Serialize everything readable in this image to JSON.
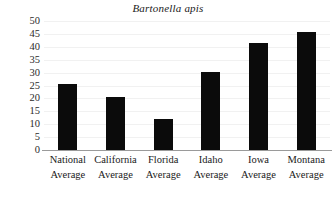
{
  "chart_data": {
    "type": "bar",
    "title": "Bartonella apis",
    "xlabel": "",
    "ylabel": "",
    "categories": [
      "National Average",
      "California Average",
      "Florida Average",
      "Idaho Average",
      "Iowa Average",
      "Montana Average"
    ],
    "category_lines": [
      [
        "National",
        "Average"
      ],
      [
        "California",
        "Average"
      ],
      [
        "Florida",
        "Average"
      ],
      [
        "Idaho",
        "Average"
      ],
      [
        "Iowa",
        "Average"
      ],
      [
        "Montana",
        "Average"
      ]
    ],
    "values": [
      25.6,
      20.5,
      12.0,
      30.2,
      41.5,
      45.7
    ],
    "ylim": [
      0,
      50
    ],
    "ytick_values": [
      0,
      5,
      10,
      15,
      20,
      25,
      30,
      35,
      40,
      45,
      50
    ],
    "ytick_labels": [
      "0",
      "5",
      "10",
      "15",
      "20",
      "25",
      "30",
      "35",
      "40",
      "45",
      "50"
    ],
    "grid": true,
    "grid_axis": "y",
    "legend": false,
    "bar_color": "#0b0b0b",
    "grid_color": "#f1f1f1",
    "axis_color": "#9a9a9a",
    "background_color": "#ffffff"
  }
}
